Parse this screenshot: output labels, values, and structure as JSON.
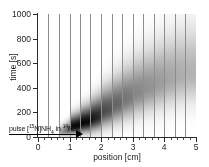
{
  "chart_data": {
    "type": "heatmap",
    "title": "",
    "xlabel": "position [cm]",
    "ylabel": "time [s]",
    "xlim": [
      0,
      5
    ],
    "ylim": [
      0,
      1000
    ],
    "xticks": [
      0,
      1,
      2,
      3,
      4,
      5
    ],
    "xticklabels": [
      "0",
      "1",
      "2",
      "3",
      "4",
      "5"
    ],
    "yticks": [
      0,
      200,
      400,
      600,
      800,
      1000
    ],
    "yticklabels": [
      "0",
      "200",
      "400",
      "600",
      "800",
      "1000"
    ],
    "x_minor_ticks": [
      0.2,
      0.4,
      0.6,
      0.8,
      1.2,
      1.4,
      1.6,
      1.8,
      2.2,
      2.4,
      2.6,
      2.8,
      3.2,
      3.4,
      3.6,
      3.8,
      4.2,
      4.4,
      4.6,
      4.8
    ],
    "grid": "vertical column separator lines only",
    "legend": "none",
    "colormap": "grayscale (white = low signal, black = high signal)",
    "column_boundaries_cm": [
      0.0,
      0.33,
      0.66,
      1.0,
      1.33,
      1.66,
      2.0,
      2.33,
      2.66,
      3.0,
      3.33,
      3.66,
      4.0,
      4.33,
      4.66,
      5.0
    ],
    "n_columns": 15,
    "columns": [
      {
        "center_cm": 0.17,
        "peak_time_s": 0,
        "spread_s": 0,
        "peak_intensity": 0.0
      },
      {
        "center_cm": 0.5,
        "peak_time_s": 0,
        "spread_s": 0,
        "peak_intensity": 0.0
      },
      {
        "center_cm": 0.83,
        "peak_time_s": 35,
        "spread_s": 25,
        "peak_intensity": 0.3
      },
      {
        "center_cm": 1.17,
        "peak_time_s": 80,
        "spread_s": 45,
        "peak_intensity": 0.95
      },
      {
        "center_cm": 1.5,
        "peak_time_s": 110,
        "spread_s": 60,
        "peak_intensity": 0.98
      },
      {
        "center_cm": 1.83,
        "peak_time_s": 140,
        "spread_s": 75,
        "peak_intensity": 0.92
      },
      {
        "center_cm": 2.17,
        "peak_time_s": 200,
        "spread_s": 95,
        "peak_intensity": 0.72
      },
      {
        "center_cm": 2.5,
        "peak_time_s": 250,
        "spread_s": 110,
        "peak_intensity": 0.62
      },
      {
        "center_cm": 2.83,
        "peak_time_s": 300,
        "spread_s": 125,
        "peak_intensity": 0.55
      },
      {
        "center_cm": 3.17,
        "peak_time_s": 350,
        "spread_s": 140,
        "peak_intensity": 0.48
      },
      {
        "center_cm": 3.5,
        "peak_time_s": 390,
        "spread_s": 150,
        "peak_intensity": 0.44
      },
      {
        "center_cm": 3.83,
        "peak_time_s": 430,
        "spread_s": 160,
        "peak_intensity": 0.4
      },
      {
        "center_cm": 4.17,
        "peak_time_s": 465,
        "spread_s": 170,
        "peak_intensity": 0.36
      },
      {
        "center_cm": 4.5,
        "peak_time_s": 495,
        "spread_s": 178,
        "peak_intensity": 0.33
      },
      {
        "center_cm": 4.83,
        "peak_time_s": 520,
        "spread_s": 185,
        "peak_intensity": 0.3
      }
    ]
  },
  "annotation": {
    "pulse_prefix": "pulse [",
    "pulse_iso_tracer_mass": "15",
    "pulse_iso_tracer_element": "N]NH",
    "pulse_tracer_sub": "4",
    "pulse_middle": " in ",
    "pulse_iso_background_mass": "14",
    "pulse_background_element": "NH",
    "pulse_background_sub": "4",
    "arrow_name": "pulse-injection-arrow"
  }
}
